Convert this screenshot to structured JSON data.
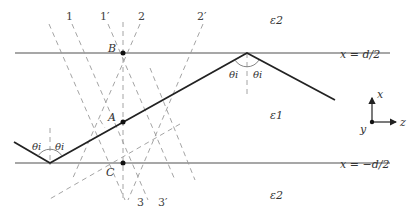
{
  "diagram": {
    "title": "",
    "media": {
      "upper": "ε2",
      "core": "ε1",
      "lower": "ε2"
    },
    "boundaries": {
      "top": "x = d/2",
      "bottom": "x = −d/2"
    },
    "points": {
      "B": "B",
      "A": "A",
      "C": "C"
    },
    "angles": {
      "theta_left_1": "θi",
      "theta_left_2": "θi",
      "theta_right_1": "θi",
      "theta_right_2": "θi"
    },
    "wavefront_labels": {
      "l1": "1",
      "l1p": "1′",
      "l2": "2",
      "l2p": "2′",
      "l3": "3",
      "l3p": "3′"
    },
    "axes": {
      "x": "x",
      "y": "y",
      "z": "z"
    },
    "colors": {
      "ray": "#222222",
      "boundary": "#8a8a8a",
      "dashed": "#9a9a9a",
      "text": "#333333"
    }
  }
}
